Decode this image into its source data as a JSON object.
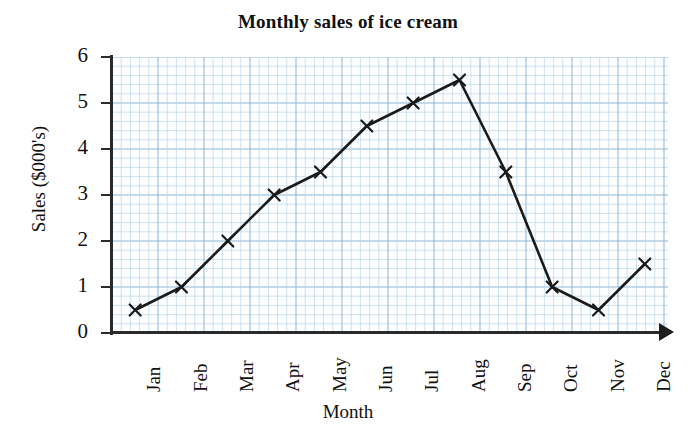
{
  "chart_data": {
    "type": "line",
    "title": "Monthly sales of ice cream",
    "xlabel": "Month",
    "ylabel": "Sales ($000's)",
    "categories": [
      "Jan",
      "Feb",
      "Mar",
      "Apr",
      "May",
      "Jun",
      "Jul",
      "Aug",
      "Sep",
      "Oct",
      "Nov",
      "Dec"
    ],
    "values": [
      0.5,
      1.0,
      2.0,
      3.0,
      3.5,
      4.5,
      5.0,
      5.5,
      3.5,
      1.0,
      0.5,
      1.5
    ],
    "ylim": [
      0,
      6
    ],
    "yticks": [
      "0",
      "1",
      "2",
      "3",
      "4",
      "5",
      "6"
    ],
    "ytick_values": [
      0,
      1,
      2,
      3,
      4,
      5,
      6
    ],
    "grid": true,
    "grid_minor_step": 0.2,
    "grid_color": "#bcd5e8",
    "grid_major_color": "#8fb5d4",
    "line_color": "#1a1a1a",
    "marker": "x",
    "legend": null,
    "axis_arrow_x": true
  },
  "figure": {
    "background": "#ffffff",
    "axis_color": "#2a2a2a"
  }
}
